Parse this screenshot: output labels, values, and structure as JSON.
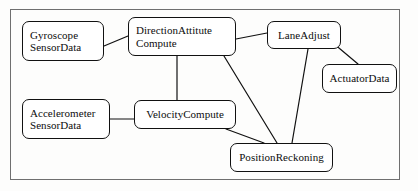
{
  "diagram": {
    "type": "node-link-graph",
    "background_color": "#fdfdfc",
    "stroke_color": "#111111",
    "frame": {
      "x": 10,
      "y": 9,
      "width": 390,
      "height": 171,
      "color": "#6f6f6f"
    },
    "nodes": [
      {
        "id": "gyroscope-sensor-data",
        "lines": [
          "Gyroscope",
          "SensorData"
        ],
        "x": 22,
        "y": 21,
        "width": 82,
        "height": 40,
        "align": "left"
      },
      {
        "id": "direction-attitute-compute",
        "lines": [
          "DirectionAttitute",
          "Compute"
        ],
        "x": 128,
        "y": 17,
        "width": 108,
        "height": 39,
        "align": "left"
      },
      {
        "id": "lane-adjust",
        "lines": [
          "LaneAdjust"
        ],
        "x": 267,
        "y": 21,
        "width": 74,
        "height": 28,
        "align": "center"
      },
      {
        "id": "actuator-data",
        "lines": [
          "ActuatorData"
        ],
        "x": 322,
        "y": 64,
        "width": 75,
        "height": 29,
        "align": "center"
      },
      {
        "id": "accelerometer-sensor-data",
        "lines": [
          "Accelerometer",
          "SensorData"
        ],
        "x": 22,
        "y": 99,
        "width": 88,
        "height": 40,
        "align": "left"
      },
      {
        "id": "velocity-compute",
        "lines": [
          "VelocityCompute"
        ],
        "x": 134,
        "y": 100,
        "width": 102,
        "height": 29,
        "align": "center"
      },
      {
        "id": "position-reckoning",
        "lines": [
          "PositionReckoning"
        ],
        "x": 230,
        "y": 143,
        "width": 103,
        "height": 29,
        "align": "center"
      }
    ],
    "edges": [
      {
        "id": "gyroscope-to-direction",
        "from": "gyroscope-sensor-data",
        "to": "direction-attitute-compute",
        "x1": 104,
        "y1": 46,
        "x2": 128,
        "y2": 36
      },
      {
        "id": "direction-to-laneadjust",
        "from": "direction-attitute-compute",
        "to": "lane-adjust",
        "x1": 236,
        "y1": 39,
        "x2": 267,
        "y2": 33
      },
      {
        "id": "direction-to-velocity",
        "from": "direction-attitute-compute",
        "to": "velocity-compute",
        "x1": 177,
        "y1": 56,
        "x2": 177,
        "y2": 100
      },
      {
        "id": "direction-to-position",
        "from": "direction-attitute-compute",
        "to": "position-reckoning",
        "x1": 224,
        "y1": 56,
        "x2": 277,
        "y2": 143
      },
      {
        "id": "laneadjust-to-actuator",
        "from": "lane-adjust",
        "to": "actuator-data",
        "x1": 333,
        "y1": 43,
        "x2": 358,
        "y2": 64
      },
      {
        "id": "laneadjust-to-position",
        "from": "lane-adjust",
        "to": "position-reckoning",
        "x1": 308,
        "y1": 49,
        "x2": 292,
        "y2": 143
      },
      {
        "id": "accelerometer-to-velocity",
        "from": "accelerometer-sensor-data",
        "to": "velocity-compute",
        "x1": 110,
        "y1": 119,
        "x2": 134,
        "y2": 119
      },
      {
        "id": "velocity-to-position",
        "from": "velocity-compute",
        "to": "position-reckoning",
        "x1": 226,
        "y1": 129,
        "x2": 264,
        "y2": 143
      }
    ]
  }
}
